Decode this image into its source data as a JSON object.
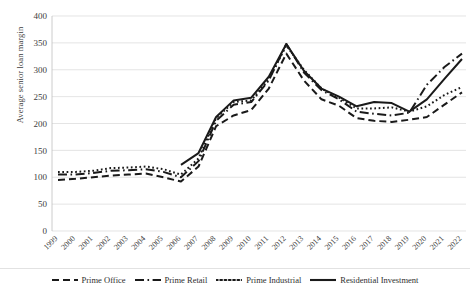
{
  "chart_data": {
    "type": "line",
    "title": "",
    "xlabel": "",
    "ylabel": "Average senior loan margin",
    "ylim": [
      0,
      400
    ],
    "ytick_step": 50,
    "yticks": [
      0,
      50,
      100,
      150,
      200,
      250,
      300,
      350,
      400
    ],
    "grid": true,
    "legend_position": "bottom",
    "categories": [
      "1999",
      "2000",
      "2001",
      "2002",
      "2003",
      "2004",
      "2005",
      "2006",
      "2007",
      "2008",
      "2009",
      "2010",
      "2011",
      "2012",
      "2013",
      "2014",
      "2015",
      "2016",
      "2017",
      "2018",
      "2019",
      "2020",
      "2021",
      "2022"
    ],
    "series": [
      {
        "name": "Prime Office",
        "style": "dashed",
        "values": [
          95,
          97,
          100,
          103,
          105,
          107,
          100,
          92,
          120,
          195,
          215,
          225,
          265,
          330,
          280,
          245,
          233,
          210,
          205,
          203,
          207,
          212,
          235,
          258
        ]
      },
      {
        "name": "Prime Retail",
        "style": "dash-dot",
        "values": [
          105,
          105,
          108,
          112,
          113,
          115,
          110,
          100,
          130,
          205,
          235,
          240,
          280,
          348,
          295,
          262,
          245,
          222,
          218,
          215,
          220,
          272,
          305,
          330
        ]
      },
      {
        "name": "Prime Industrial",
        "style": "dotted",
        "values": [
          110,
          110,
          112,
          117,
          118,
          120,
          115,
          105,
          135,
          210,
          240,
          243,
          282,
          345,
          300,
          265,
          248,
          228,
          228,
          230,
          222,
          232,
          253,
          268
        ]
      },
      {
        "name": "Residential Investment",
        "style": "solid",
        "values": [
          null,
          null,
          null,
          null,
          null,
          null,
          null,
          123,
          145,
          212,
          243,
          248,
          287,
          348,
          298,
          265,
          250,
          232,
          240,
          238,
          222,
          245,
          283,
          320
        ]
      }
    ]
  },
  "legend": {
    "items": [
      {
        "label": "Prime Office",
        "swatch": "dashed-swatch"
      },
      {
        "label": "Prime Retail",
        "swatch": "dash-dot-swatch"
      },
      {
        "label": "Prime Industrial",
        "swatch": "dotted-swatch"
      },
      {
        "label": "Residential Investment",
        "swatch": "solid-swatch"
      }
    ]
  },
  "colors": {
    "line": "#1a1a1a",
    "grid": "#d9d9d9",
    "text": "#404040",
    "background": "#ffffff"
  }
}
